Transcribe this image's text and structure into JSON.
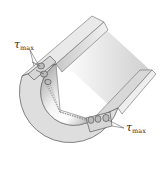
{
  "diagram": {
    "labels": [
      {
        "id": "tau-top",
        "symbol": "τ",
        "subscript": "max"
      },
      {
        "id": "tau-bottom",
        "symbol": "τ",
        "subscript": "max"
      }
    ],
    "colors": {
      "face": "#dcdcdc",
      "outline": "#555555",
      "bore_light": "#ffffff",
      "bore_dark": "#8a8a8a",
      "wall_top": "#eeeeee",
      "wall_side": "#bdbdbd"
    }
  }
}
